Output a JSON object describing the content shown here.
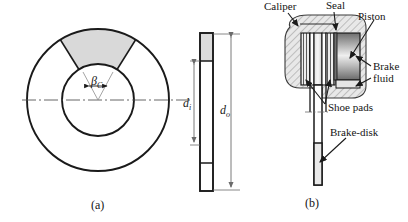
{
  "figure": {
    "captions": [
      {
        "id": "a",
        "text": "(a)"
      },
      {
        "id": "b",
        "text": "(b)"
      }
    ]
  },
  "part_a": {
    "name": "brake-disk-face-and-side-view",
    "angle_label": {
      "symbol": "β",
      "subscript": "C"
    },
    "dimensions": [
      {
        "id": "inner_diameter",
        "symbol": "d",
        "subscript": "i"
      },
      {
        "id": "outer_diameter",
        "symbol": "d",
        "subscript": "o"
      }
    ],
    "geometry": {
      "outer_circle": {
        "cx": 98,
        "cy": 100,
        "r": 71
      },
      "inner_circle": {
        "cx": 98,
        "cy": 100,
        "r": 36
      },
      "sector_start_deg": 122,
      "sector_end_deg": 58,
      "sector_fill": "#d9d9d9"
    },
    "side_view": {
      "x": 200,
      "y": 33,
      "width": 13,
      "height": 158,
      "pad_fill": "#dcdcdc"
    }
  },
  "part_b": {
    "name": "caliper-assembly-cross-section",
    "labels": [
      {
        "id": "caliper",
        "text": "Caliper"
      },
      {
        "id": "seal",
        "text": "Seal"
      },
      {
        "id": "piston",
        "text": "Piston"
      },
      {
        "id": "brake_fluid_line1",
        "text": "Brake"
      },
      {
        "id": "brake_fluid_line2",
        "text": "fluid"
      },
      {
        "id": "shoe_pads",
        "text": "Shoe pads"
      },
      {
        "id": "brake_disk",
        "text": "Brake-disk"
      }
    ]
  },
  "colors": {
    "stroke": "#1a1a1a",
    "sector_gray": "#d9d9d9",
    "hatch_gray": "#b8b8b8",
    "piston_light": "#f2f2f2",
    "piston_dark": "#8a8a8a",
    "centerline": "#555555",
    "dim_line": "#6b6b6b"
  }
}
